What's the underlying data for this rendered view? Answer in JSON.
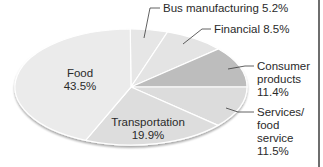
{
  "chart_data": {
    "type": "pie",
    "title": "",
    "slices": [
      {
        "label": "Bus manufacturing",
        "value": 5.2,
        "display": "Bus manufacturing 5.2%",
        "color": "#e6e6e6"
      },
      {
        "label": "Financial",
        "value": 8.5,
        "display": "Financial 8.5%",
        "color": "#e4e4e4"
      },
      {
        "label": "Consumer products",
        "value": 11.4,
        "display": "11.4%",
        "color": "#bdbdbd"
      },
      {
        "label": "Services/ food service",
        "value": 11.5,
        "display": "11.5%",
        "color": "#dcdcdc"
      },
      {
        "label": "Transportation",
        "value": 19.9,
        "display": "19.9%",
        "color": "#dddddd"
      },
      {
        "label": "Food",
        "value": 43.5,
        "display": "43.5%",
        "color": "#ebebeb"
      }
    ],
    "categories": [
      "Bus manufacturing",
      "Financial",
      "Consumer products",
      "Services/food service",
      "Transportation",
      "Food"
    ],
    "values": [
      5.2,
      8.5,
      11.4,
      11.5,
      19.9,
      43.5
    ],
    "legend": "none (callout labels)"
  },
  "labels": {
    "bus": "Bus manufacturing 5.2%",
    "financial": "Financial 8.5%",
    "consumer_1": "Consumer",
    "consumer_2": "products",
    "consumer_3": "11.4%",
    "services_1": "Services/",
    "services_2": "food",
    "services_3": "service",
    "services_4": "11.5%",
    "transport_1": "Transportation",
    "transport_2": "19.9%",
    "food_1": "Food",
    "food_2": "43.5%"
  }
}
